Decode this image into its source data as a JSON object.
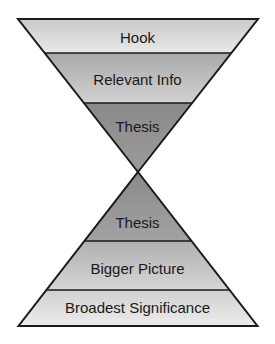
{
  "diagram": {
    "top_funnel": {
      "layers": [
        {
          "label": "Hook"
        },
        {
          "label": "Relevant Info"
        },
        {
          "label": "Thesis"
        }
      ]
    },
    "bottom_pyramid": {
      "layers": [
        {
          "label": "Thesis"
        },
        {
          "label": "Bigger Picture"
        },
        {
          "label": "Broadest Significance"
        }
      ]
    },
    "colors": {
      "light_fill": "#e6e6e6",
      "mid_fill": "#bdbdbd",
      "dark_fill": "#8c8c8c",
      "outline": "#1a1a1a"
    }
  }
}
